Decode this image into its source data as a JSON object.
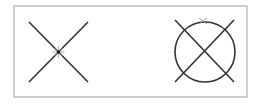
{
  "diagram": {
    "frame": {
      "x": 14,
      "y": 6,
      "width": 233,
      "height": 91,
      "stroke": "#b0b0b0"
    },
    "line_color": "#333333",
    "marker_color": "#999999",
    "figures": [
      {
        "name": "crossing-lines",
        "lines": [
          {
            "x1": 29,
            "y1": 22,
            "x2": 88,
            "y2": 82
          },
          {
            "x1": 88,
            "y1": 22,
            "x2": 29,
            "y2": 82
          }
        ],
        "intersection_marker": {
          "x": 58.5,
          "y": 52,
          "type": "star"
        }
      },
      {
        "name": "circle-with-crossing-lines",
        "circle": {
          "cx": 205,
          "cy": 52,
          "r": 30
        },
        "lines": [
          {
            "x1": 175,
            "y1": 20,
            "x2": 234,
            "y2": 82
          },
          {
            "x1": 234,
            "y1": 20,
            "x2": 175,
            "y2": 82
          }
        ],
        "top_marker": {
          "x": 203,
          "y": 21,
          "type": "x"
        }
      }
    ]
  }
}
